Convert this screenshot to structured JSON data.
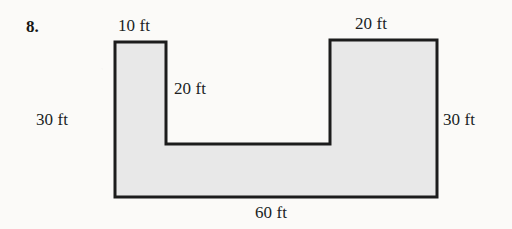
{
  "problem": {
    "number": "8."
  },
  "figure": {
    "type": "u-shaped-polygon",
    "fill_color": "#e8e8e8",
    "stroke_color": "#1c1c1c",
    "background_color": "#fbfaf8",
    "vertices": [
      [
        115,
        42
      ],
      [
        166,
        42
      ],
      [
        166,
        144
      ],
      [
        330,
        144
      ],
      [
        330,
        40
      ],
      [
        437,
        40
      ],
      [
        437,
        197
      ],
      [
        115,
        197
      ]
    ],
    "labels": {
      "top_left": "10 ft",
      "top_right": "20 ft",
      "inner_notch": "20 ft",
      "left_side": "30 ft",
      "right_side": "30 ft",
      "bottom": "60 ft"
    }
  }
}
